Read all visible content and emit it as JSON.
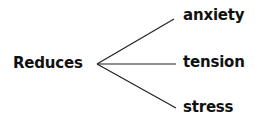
{
  "diagram": {
    "root": "Reduces",
    "branches": [
      "anxiety",
      "tension",
      "stress"
    ],
    "line_color": "#222222"
  }
}
